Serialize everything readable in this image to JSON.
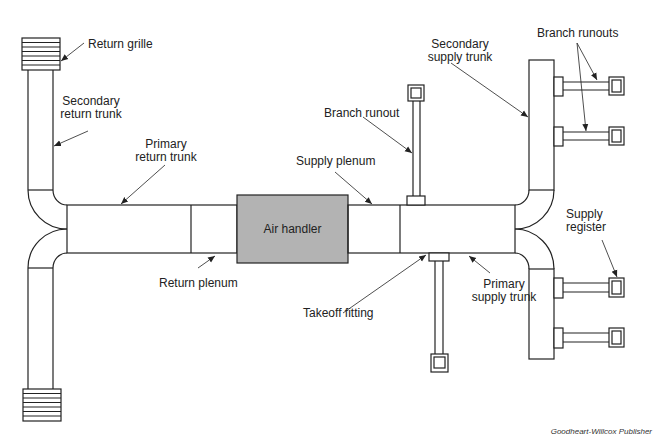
{
  "diagram": {
    "type": "hvac-duct-layout",
    "colors": {
      "line": "#222222",
      "air_handler_fill": "#b3b3b3",
      "background": "#ffffff"
    },
    "components": {
      "air_handler": "Air handler"
    },
    "labels": {
      "return_grille": "Return grille",
      "secondary_return_trunk_1": "Secondary",
      "secondary_return_trunk_2": "return trunk",
      "primary_return_trunk_1": "Primary",
      "primary_return_trunk_2": "return trunk",
      "return_plenum": "Return plenum",
      "supply_plenum": "Supply plenum",
      "branch_runout": "Branch runout",
      "secondary_supply_trunk_1": "Secondary",
      "secondary_supply_trunk_2": "supply trunk",
      "branch_runouts": "Branch runouts",
      "supply_register_1": "Supply",
      "supply_register_2": "register",
      "takeoff_fitting": "Takeoff fitting",
      "primary_supply_trunk_1": "Primary",
      "primary_supply_trunk_2": "supply trunk"
    },
    "credit": "Goodheart-Willcox Publisher"
  }
}
